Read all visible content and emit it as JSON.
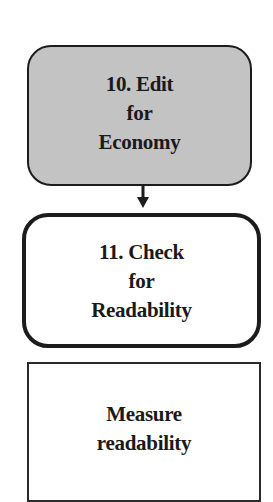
{
  "diagram": {
    "type": "flowchart",
    "nodes": [
      {
        "id": "10",
        "shape": "rounded-rectangle",
        "fill": "#c3c3c3",
        "lines": [
          "10. Edit",
          "for",
          "Economy"
        ]
      },
      {
        "id": "11",
        "shape": "rounded-rectangle",
        "border": "thick",
        "fill": "#ffffff",
        "lines": [
          "11. Check",
          "for",
          "Readability"
        ]
      },
      {
        "id": "measure",
        "shape": "rectangle",
        "fill": "#ffffff",
        "lines": [
          "Measure",
          "readability"
        ]
      }
    ],
    "edges": [
      {
        "from": "10",
        "to": "11",
        "style": "arrow-down"
      }
    ],
    "colors": {
      "stroke": "#1c1c1c",
      "gray_fill": "#c3c3c3",
      "background": "#ffffff"
    }
  }
}
